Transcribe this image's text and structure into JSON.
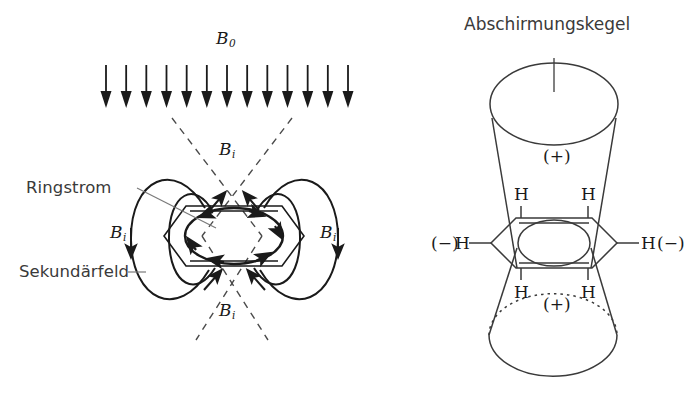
{
  "figure": {
    "background": "#ffffff",
    "ink": "#1a1a1a",
    "label_ink": "#3a3a3a",
    "width": 692,
    "height": 417
  },
  "left_panel": {
    "name": "ring-current-diagram",
    "external_field": {
      "symbol": "B",
      "subscript": "0",
      "arrow_count": 13,
      "direction": "down"
    },
    "induced_field_label": {
      "symbol": "B",
      "subscript": "i",
      "occurrences": 4,
      "positions": [
        "top-center",
        "left",
        "right",
        "bottom-center"
      ]
    },
    "callouts": [
      {
        "id": "ring-current",
        "text": "Ringstrom"
      },
      {
        "id": "secondary-field",
        "text": "Sekundärfeld"
      }
    ],
    "ring_current_direction": "counterclockwise",
    "cone_boundary_style": "dashed"
  },
  "right_panel": {
    "name": "shielding-cone-diagram",
    "title": "Abschirmungskegel",
    "cone_regions": [
      {
        "id": "upper-cone",
        "sign": "(+)",
        "meaning": "shielding"
      },
      {
        "id": "lower-cone",
        "sign": "(+)",
        "meaning": "shielding"
      }
    ],
    "hydrogens": [
      {
        "id": "h-upper-left",
        "label": "H"
      },
      {
        "id": "h-upper-right",
        "label": "H"
      },
      {
        "id": "h-lower-left",
        "label": "H"
      },
      {
        "id": "h-lower-right",
        "label": "H"
      },
      {
        "id": "h-left-edge",
        "label": "H",
        "sign": "(−)"
      },
      {
        "id": "h-right-edge",
        "label": "H",
        "sign": "(−)"
      }
    ],
    "equator_sign_left": "(−)",
    "equator_sign_right": "(−)"
  }
}
